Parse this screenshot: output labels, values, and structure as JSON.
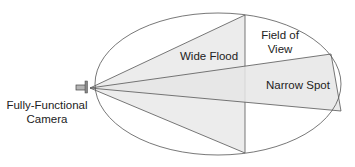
{
  "diagram": {
    "camera_label_line1": "Fully-Functional",
    "camera_label_line2": "Camera",
    "wide_flood_label": "Wide Flood",
    "narrow_spot_label": "Narrow Spot",
    "fov_label_line1": "Field of",
    "fov_label_line2": "View",
    "colors": {
      "line": "#555555",
      "cone_fill": "#ececec",
      "camera_fill": "#b5b5b5",
      "background": "#ffffff"
    }
  }
}
